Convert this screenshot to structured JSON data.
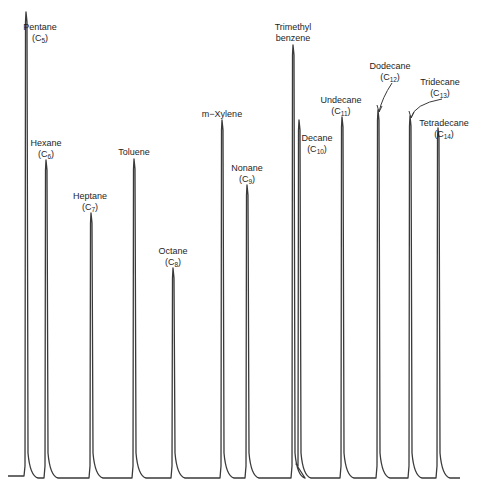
{
  "chart_data": {
    "type": "line",
    "title": "",
    "subtitle": "",
    "xlabel": "",
    "ylabel": "",
    "grid": false,
    "legend": null,
    "baseline_y_px": 478,
    "line_color": "#3a3a3a",
    "peaks": [
      {
        "name": "Pentane",
        "formula_base": "C",
        "formula_sub": "5",
        "x": 26,
        "top": 12,
        "label_x": 40,
        "label_y": 22
      },
      {
        "name": "Hexane",
        "formula_base": "C",
        "formula_sub": "6",
        "x": 46,
        "top": 160,
        "label_x": 46,
        "label_y": 138
      },
      {
        "name": "Heptane",
        "formula_base": "C",
        "formula_sub": "7",
        "x": 91,
        "top": 213,
        "label_x": 90,
        "label_y": 191
      },
      {
        "name": "Toluene",
        "formula_base": "",
        "formula_sub": "",
        "x": 134,
        "top": 159,
        "label_x": 134,
        "label_y": 147
      },
      {
        "name": "Octane",
        "formula_base": "C",
        "formula_sub": "8",
        "x": 173,
        "top": 268,
        "label_x": 173,
        "label_y": 246
      },
      {
        "name": "m−Xylene",
        "formula_base": "",
        "formula_sub": "",
        "x": 222,
        "top": 120,
        "label_x": 222,
        "label_y": 109
      },
      {
        "name": "Nonane",
        "formula_base": "C",
        "formula_sub": "9",
        "x": 247,
        "top": 185,
        "label_x": 247,
        "label_y": 163
      },
      {
        "name": "Trimethyl benzene",
        "formula_base": "",
        "formula_sub": "",
        "x": 293,
        "top": 45,
        "label_x": 293,
        "label_y": 22
      },
      {
        "name": "Decane",
        "formula_base": "C",
        "formula_sub": "10",
        "x": 299,
        "top": 120,
        "label_x": 317,
        "label_y": 133
      },
      {
        "name": "Undecane",
        "formula_base": "C",
        "formula_sub": "11",
        "x": 342,
        "top": 117,
        "label_x": 341,
        "label_y": 95
      },
      {
        "name": "Dodecane",
        "formula_base": "C",
        "formula_sub": "12",
        "x": 378,
        "top": 110,
        "label_x": 390,
        "label_y": 61,
        "arrow": true
      },
      {
        "name": "Tridecane",
        "formula_base": "C",
        "formula_sub": "13",
        "x": 410,
        "top": 116,
        "label_x": 440,
        "label_y": 77,
        "arrow": true
      },
      {
        "name": "Tetradecane",
        "formula_base": "C",
        "formula_sub": "14",
        "x": 438,
        "top": 128,
        "label_x": 444,
        "label_y": 118
      }
    ]
  }
}
